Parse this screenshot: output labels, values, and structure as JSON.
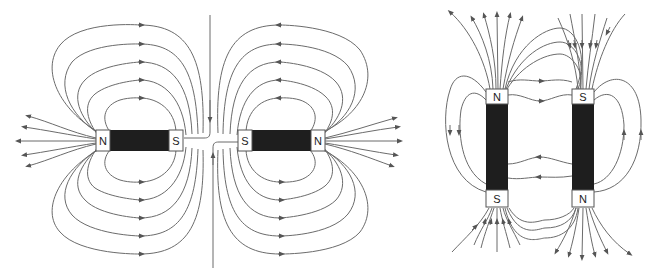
{
  "diagrams": [
    {
      "id": "repelling-horizontal",
      "description": "Two bar magnets facing S to S with repelling field lines and neutral vertical line between them",
      "magnets": [
        {
          "left_pole": "N",
          "right_pole": "S"
        },
        {
          "left_pole": "S",
          "right_pole": "N"
        }
      ]
    },
    {
      "id": "attracting-vertical",
      "description": "Two vertical bar magnets side by side with opposite orientation; field lines connect N to S",
      "magnets": [
        {
          "top_pole": "N",
          "bottom_pole": "S"
        },
        {
          "top_pole": "S",
          "bottom_pole": "N"
        }
      ]
    }
  ],
  "colors": {
    "field_line": "#6b6b6b",
    "arrow": "#555555",
    "magnet_body": "#1e1e1e",
    "pole_face": "#ffffff"
  }
}
